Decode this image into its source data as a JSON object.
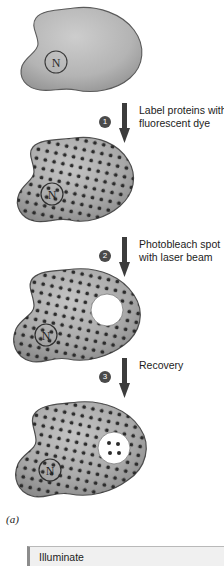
{
  "figure": {
    "panel_label": "(a)",
    "title_implied": "FRAP: fluorescence recovery after photobleaching"
  },
  "colors": {
    "cell_fill_plain": "#b0b0b0",
    "cell_fill_labeled": "#9a9a9a",
    "cell_edge": "#555555",
    "dot": "#2b2b2b",
    "bleach_spot": "#ffffff",
    "arrow": "#3c3c3c",
    "badge": "#4a4a4a",
    "text": "#1c1c1c",
    "panel_bg": "#f0f0f0"
  },
  "cells": [
    {
      "id": "cell-unlabeled",
      "nucleus_label": "N",
      "state": "unlabeled",
      "dots": 0,
      "bleach_spot": false
    },
    {
      "id": "cell-labeled",
      "nucleus_label": "N",
      "state": "labeled",
      "dots": 150,
      "bleach_spot": false
    },
    {
      "id": "cell-bleached",
      "nucleus_label": "N",
      "state": "bleached",
      "dots": 150,
      "bleach_spot": true,
      "bleach_spot_dots": 0
    },
    {
      "id": "cell-recovered",
      "nucleus_label": "N",
      "state": "recovering",
      "dots": 150,
      "bleach_spot": true,
      "bleach_spot_dots": 4
    }
  ],
  "steps": [
    {
      "number": "1",
      "text": "Label proteins with\nfluorescent dye"
    },
    {
      "number": "2",
      "text": "Photobleach spot\nwith laser beam"
    },
    {
      "number": "3",
      "text": "Recovery"
    }
  ],
  "bottom_panel": {
    "text": "Illuminate"
  }
}
